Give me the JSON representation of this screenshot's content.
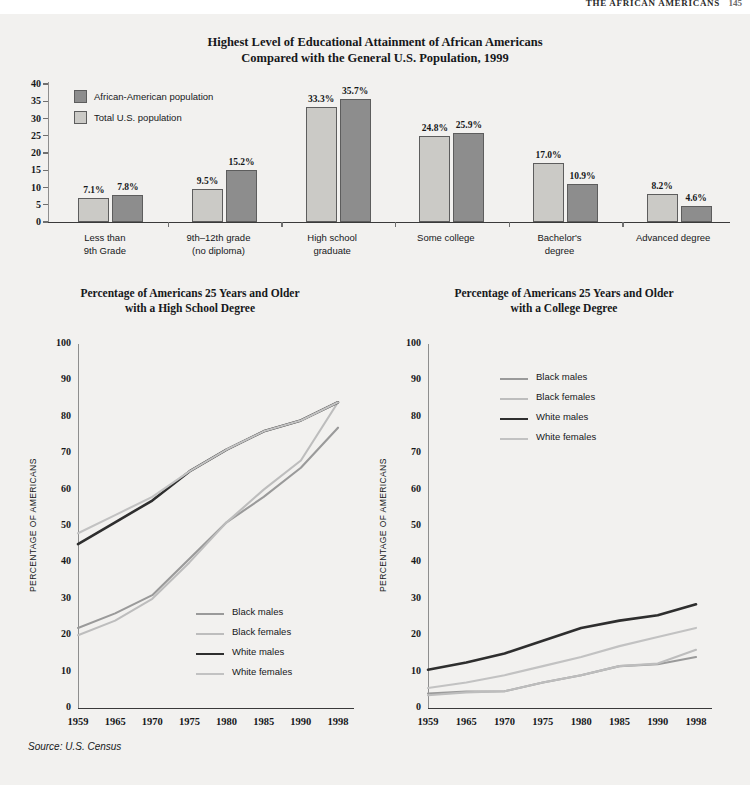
{
  "running_head": {
    "text": "THE AFRICAN AMERICANS",
    "page": "145"
  },
  "source_note": "Source: U.S. Census",
  "colors": {
    "background": "#f2f1ef",
    "bar_dark": "#8d8d8d",
    "bar_light": "#cbcac6",
    "black_males": "#9a9a9a",
    "black_females": "#bdbdbd",
    "white_males": "#2e2e2e",
    "white_females": "#c2c2c2",
    "axis": "#8e8e8e",
    "text": "#16181a"
  },
  "bar_chart": {
    "title_line1": "Highest Level of Educational Attainment of African Americans",
    "title_line2": "Compared with the General U.S. Population, 1999",
    "legend": [
      {
        "label": "African-American population",
        "swatch": "dark"
      },
      {
        "label": "Total U.S. population",
        "swatch": "light"
      }
    ],
    "y_ticks": [
      "40",
      "35",
      "30",
      "25",
      "20",
      "15",
      "10",
      "5",
      "0"
    ]
  },
  "hs_chart": {
    "title_line1": "Percentage of Americans 25 Years and Older",
    "title_line2": "with a High School Degree",
    "y_axis_caption": "PERCENTAGE OF AMERICANS",
    "y_ticks": [
      "100",
      "90",
      "80",
      "70",
      "60",
      "50",
      "40",
      "30",
      "20",
      "10",
      "0"
    ],
    "legend": [
      {
        "label": "Black males",
        "color": "#9a9a9a",
        "width": 2.2
      },
      {
        "label": "Black females",
        "color": "#bdbdbd",
        "width": 2.2
      },
      {
        "label": "White males",
        "color": "#2e2e2e",
        "width": 2.6
      },
      {
        "label": "White females",
        "color": "#c2c2c2",
        "width": 2.2
      }
    ]
  },
  "col_chart": {
    "title_line1": "Percentage of Americans 25 Years and Older",
    "title_line2": "with a College Degree",
    "y_axis_caption": "PERCENTAGE OF AMERICANS",
    "y_ticks": [
      "100",
      "90",
      "80",
      "70",
      "60",
      "50",
      "40",
      "30",
      "20",
      "10",
      "0"
    ],
    "legend": [
      {
        "label": "Black males",
        "color": "#9a9a9a",
        "width": 2.2
      },
      {
        "label": "Black females",
        "color": "#bdbdbd",
        "width": 2.2
      },
      {
        "label": "White males",
        "color": "#2e2e2e",
        "width": 2.6
      },
      {
        "label": "White females",
        "color": "#c2c2c2",
        "width": 2.2
      }
    ]
  },
  "chart_data": [
    {
      "id": "educational-attainment-bar",
      "type": "bar",
      "title": "Highest Level of Educational Attainment of African Americans Compared with the General U.S. Population, 1999",
      "xlabel": "",
      "ylabel": "",
      "ylim": [
        0,
        40
      ],
      "ytick_step": 5,
      "grid": false,
      "legend_position": "top-left",
      "value_labels": true,
      "categories": [
        "Less than 9th Grade",
        "9th–12th grade (no diploma)",
        "High school graduate",
        "Some college",
        "Bachelor's degree",
        "Advanced degree"
      ],
      "category_lines": [
        [
          "Less than",
          "9th Grade"
        ],
        [
          "9th–12th grade",
          "(no diploma)"
        ],
        [
          "High school",
          "graduate"
        ],
        [
          "Some college",
          ""
        ],
        [
          "Bachelor's",
          "degree"
        ],
        [
          "Advanced degree",
          ""
        ]
      ],
      "series": [
        {
          "name": "Total U.S. population",
          "color": "#cbcac6",
          "values": [
            7.1,
            9.5,
            33.3,
            24.8,
            17.0,
            8.2
          ],
          "labels": [
            "7.1%",
            "9.5%",
            "33.3%",
            "24.8%",
            "17.0%",
            "8.2%"
          ]
        },
        {
          "name": "African-American population",
          "color": "#8d8d8d",
          "values": [
            7.8,
            15.2,
            35.7,
            25.9,
            10.9,
            4.6
          ],
          "labels": [
            "7.8%",
            "15.2%",
            "35.7%",
            "25.9%",
            "10.9%",
            "4.6%"
          ]
        }
      ]
    },
    {
      "id": "high-school-degree-line",
      "type": "line",
      "title": "Percentage of Americans 25 Years and Older with a High School Degree",
      "xlabel": "",
      "ylabel": "PERCENTAGE OF AMERICANS",
      "ylim": [
        0,
        100
      ],
      "ytick_step": 10,
      "grid": false,
      "legend_position": "bottom-right",
      "x": [
        "1959",
        "1965",
        "1970",
        "1975",
        "1980",
        "1985",
        "1990",
        "1998"
      ],
      "series": [
        {
          "name": "Black males",
          "color": "#9a9a9a",
          "values": [
            22,
            26,
            31,
            41,
            51,
            58,
            66,
            77
          ]
        },
        {
          "name": "Black females",
          "color": "#bdbdbd",
          "values": [
            20,
            24,
            30,
            40,
            51,
            60,
            68,
            84
          ]
        },
        {
          "name": "White males",
          "color": "#2e2e2e",
          "values": [
            45,
            51,
            57,
            65,
            71,
            76,
            79,
            84
          ]
        },
        {
          "name": "White females",
          "color": "#c2c2c2",
          "values": [
            48,
            53,
            58,
            65,
            71,
            76,
            79,
            84
          ]
        }
      ]
    },
    {
      "id": "college-degree-line",
      "type": "line",
      "title": "Percentage of Americans 25 Years and Older with a College Degree",
      "xlabel": "",
      "ylabel": "PERCENTAGE OF AMERICANS",
      "ylim": [
        0,
        100
      ],
      "ytick_step": 10,
      "grid": false,
      "legend_position": "top-right",
      "x": [
        "1959",
        "1965",
        "1970",
        "1975",
        "1980",
        "1985",
        "1990",
        "1998"
      ],
      "series": [
        {
          "name": "Black males",
          "color": "#9a9a9a",
          "values": [
            4.0,
            4.5,
            4.6,
            7.0,
            9.0,
            11.5,
            12.0,
            14.0
          ]
        },
        {
          "name": "Black females",
          "color": "#bdbdbd",
          "values": [
            3.5,
            4.3,
            4.6,
            7.0,
            9.0,
            11.5,
            12.2,
            16.0
          ]
        },
        {
          "name": "White males",
          "color": "#2e2e2e",
          "values": [
            10.5,
            12.5,
            15.0,
            18.5,
            22.0,
            24.0,
            25.5,
            28.5
          ]
        },
        {
          "name": "White females",
          "color": "#c2c2c2",
          "values": [
            5.5,
            7.0,
            9.0,
            11.5,
            14.0,
            17.0,
            19.5,
            22.0
          ]
        }
      ]
    }
  ]
}
